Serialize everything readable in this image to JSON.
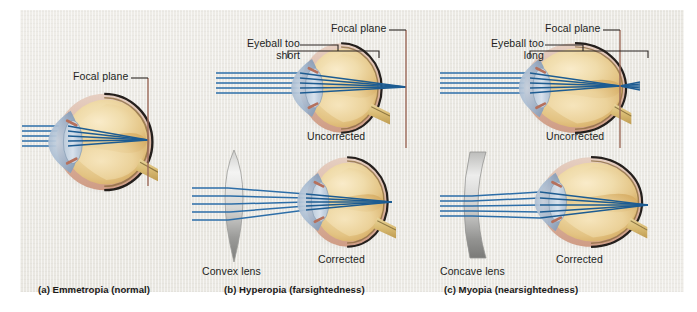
{
  "figure": {
    "background_color": "#eceae4",
    "outer_color": "#ffffff"
  },
  "colors": {
    "ray": "#2d6ea8",
    "ray_dark": "#1d5c92",
    "focal_plane_line": "#9c6a5a",
    "bracket": "#2a2522",
    "leader": "#2a2522",
    "sclera_outline": "#2b2522",
    "vitreous_light": "#f3dfb0",
    "vitreous_mid": "#e8c98a",
    "vitreous_deep": "#d8ae63",
    "cornea_blue": "#8fa8c4",
    "lens_blue": "#a9bdd2",
    "choroid_pink": "#d9a08e",
    "optic_nerve": "#d9bb73",
    "lens_glass_light": "#f2f2f1",
    "lens_glass_dark": "#8e8e8c"
  },
  "panels": [
    {
      "id": "a",
      "caption": "(a) Emmetropia (normal)",
      "diagrams": [
        {
          "id": "a-normal",
          "state_label": "",
          "annotations": [
            {
              "name": "focal-plane",
              "text": "Focal plane"
            }
          ],
          "corrective_lens": null,
          "ray_count": 5,
          "focus_point": "on retina"
        }
      ]
    },
    {
      "id": "b",
      "caption": "(b) Hyperopia (farsightedness)",
      "diagrams": [
        {
          "id": "b-uncorrected",
          "state_label": "Uncorrected",
          "annotations": [
            {
              "name": "eyeball-too-short",
              "line1": "Eyeball too",
              "line2": "short"
            },
            {
              "name": "focal-plane",
              "text": "Focal plane"
            }
          ],
          "corrective_lens": null,
          "ray_count": 5,
          "focus_point": "behind retina"
        },
        {
          "id": "b-corrected",
          "state_label": "Corrected",
          "annotations": [],
          "corrective_lens": {
            "name": "convex-lens",
            "label": "Convex lens",
            "shape": "biconvex"
          },
          "ray_count": 5,
          "focus_point": "on retina"
        }
      ]
    },
    {
      "id": "c",
      "caption": "(c) Myopia (nearsightedness)",
      "diagrams": [
        {
          "id": "c-uncorrected",
          "state_label": "Uncorrected",
          "annotations": [
            {
              "name": "eyeball-too-long",
              "line1": "Eyeball too",
              "line2": "long"
            },
            {
              "name": "focal-plane",
              "text": "Focal plane"
            }
          ],
          "corrective_lens": null,
          "ray_count": 5,
          "focus_point": "in front of retina"
        },
        {
          "id": "c-corrected",
          "state_label": "Corrected",
          "annotations": [],
          "corrective_lens": {
            "name": "concave-lens",
            "label": "Concave lens",
            "shape": "biconcave"
          },
          "ray_count": 5,
          "focus_point": "on retina"
        }
      ]
    }
  ],
  "labels": {
    "a_focal_plane": "Focal plane",
    "b_eye_short_l1": "Eyeball too",
    "b_eye_short_l2": "short",
    "b_focal_plane": "Focal plane",
    "b_uncorrected": "Uncorrected",
    "b_corrected": "Corrected",
    "b_lens": "Convex lens",
    "b_caption": "(b) Hyperopia (farsightedness)",
    "a_caption": "(a) Emmetropia (normal)",
    "c_eye_long_l1": "Eyeball too",
    "c_eye_long_l2": "long",
    "c_focal_plane": "Focal plane",
    "c_uncorrected": "Uncorrected",
    "c_corrected": "Corrected",
    "c_lens": "Concave lens",
    "c_caption": "(c) Myopia (nearsightedness)"
  }
}
